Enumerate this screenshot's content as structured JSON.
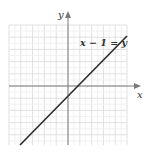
{
  "chart_data": {
    "type": "line",
    "title": "",
    "xlabel": "x",
    "ylabel": "y",
    "equation_label": "x − 1 = y",
    "series": [
      {
        "name": "x − 1 = y",
        "x": [
          -5,
          5
        ],
        "y": [
          -6,
          4
        ]
      }
    ],
    "xlim": [
      -5,
      5
    ],
    "ylim": [
      -5,
      5
    ],
    "grid": true,
    "legend": "none",
    "colors": {
      "line": "#2b2b2b",
      "axis": "#7a7a7a",
      "grid": "#e2e2e2",
      "label": "#333333"
    }
  },
  "labels": {
    "x_axis": "x",
    "y_axis": "y",
    "equation": "x − 1 = y"
  }
}
